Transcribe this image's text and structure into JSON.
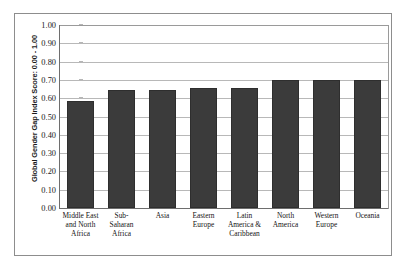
{
  "chart": {
    "type": "bar",
    "y_axis_title": "Global Gender Gap Index Score: 0.00 - 1.00",
    "bar_color": "#3b3b3b",
    "gridline_color": "#b8b8b8",
    "axis_color": "#6e6e6e"
  },
  "chart_data": {
    "type": "bar",
    "title": "",
    "xlabel": "",
    "ylabel": "Global Gender Gap Index Score: 0.00 - 1.00",
    "ylim": [
      0.0,
      1.0
    ],
    "yticks": [
      "0.00",
      "0.10",
      "0.20",
      "0.30",
      "0.40",
      "0.50",
      "0.60",
      "0.70",
      "0.80",
      "0.90",
      "1.00"
    ],
    "ytick_values": [
      0.0,
      0.1,
      0.2,
      0.3,
      0.4,
      0.5,
      0.6,
      0.7,
      0.8,
      0.9,
      1.0
    ],
    "grid": true,
    "legend": "none",
    "categories": [
      "Middle East and North Africa",
      "Sub-Saharan Africa",
      "Asia",
      "Eastern Europe",
      "Latin America & Caribbean",
      "North America",
      "Western Europe",
      "Oceania"
    ],
    "category_lines": [
      [
        "Middle East",
        "and North",
        "Africa"
      ],
      [
        "Sub-",
        "Saharan",
        "Africa"
      ],
      [
        "Asia"
      ],
      [
        "Eastern",
        "Europe"
      ],
      [
        "Latin",
        "America &",
        "Caribbean"
      ],
      [
        "North",
        "America"
      ],
      [
        "Western",
        "Europe"
      ],
      [
        "Oceania"
      ]
    ],
    "values": [
      0.585,
      0.645,
      0.645,
      0.655,
      0.655,
      0.7,
      0.7,
      0.7
    ]
  }
}
